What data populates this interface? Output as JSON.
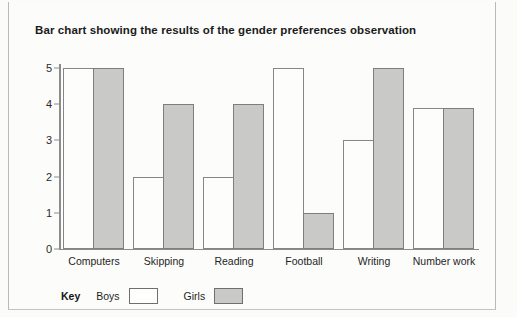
{
  "page": {
    "title": "Bar chart showing the results of the gender preferences observation"
  },
  "legend": {
    "key_label": "Key",
    "entries": [
      {
        "label": "Boys",
        "color": "#ffffff"
      },
      {
        "label": "Girls",
        "color": "#c9c9c7"
      }
    ]
  },
  "chart_data": {
    "type": "bar",
    "title": "Bar chart showing the results of the gender preferences observation",
    "xlabel": "",
    "ylabel": "",
    "ylim": [
      0,
      5
    ],
    "yticks": [
      0,
      1,
      2,
      3,
      4,
      5
    ],
    "grid": false,
    "legend_position": "bottom-left",
    "categories": [
      "Computers",
      "Skipping",
      "Reading",
      "Football",
      "Writing",
      "Number work"
    ],
    "series": [
      {
        "name": "Boys",
        "color": "#ffffff",
        "values": [
          5,
          2,
          2,
          5,
          3,
          3.9
        ]
      },
      {
        "name": "Girls",
        "color": "#c9c9c7",
        "values": [
          5,
          4,
          4,
          1,
          5,
          3.9
        ]
      }
    ]
  }
}
